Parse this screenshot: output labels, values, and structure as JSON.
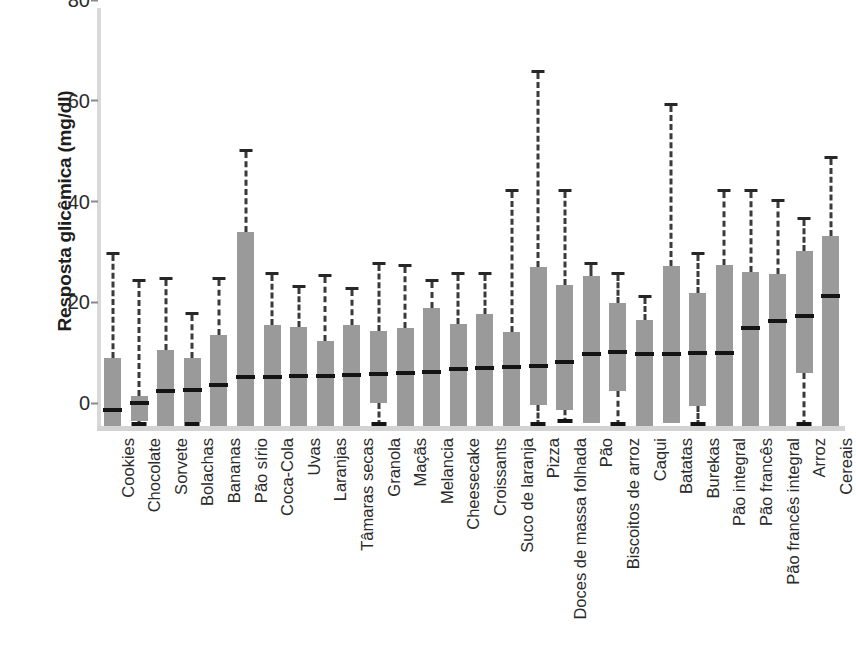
{
  "chart_data": {
    "type": "box",
    "title": "",
    "xlabel": "",
    "ylabel": "Resposta glicêmica (mg/dl)",
    "ylim": [
      0,
      83
    ],
    "yticks": [
      0,
      20,
      40,
      60,
      80
    ],
    "grid": false,
    "legend": "none",
    "units": "mg/dl",
    "categories": [
      "Cookies",
      "Chocolate",
      "Sorvete",
      "Bolachas",
      "Bananas",
      "Pão sírio",
      "Coca-Cola",
      "Uvas",
      "Laranjas",
      "Tâmaras secas",
      "Granola",
      "Maçãs",
      "Melancia",
      "Cheesecake",
      "Croissants",
      "Suco de laranja",
      "Pizza",
      "Doces de massa folhada",
      "Pão",
      "Biscoitos de arroz",
      "Caqui",
      "Batatas",
      "Burekas",
      "Pão integral",
      "Pão francês",
      "Pão francês integral",
      "Arroz",
      "Cereais"
    ],
    "boxes": [
      {
        "label": "Cookies",
        "whisker_low": 0,
        "q1": 0,
        "median": 2.8,
        "q3": 13.5,
        "whisker_high": 34.0
      },
      {
        "label": "Chocolate",
        "whisker_low": 0,
        "q1": 1.0,
        "median": 4.2,
        "q3": 6.0,
        "whisker_high": 28.5
      },
      {
        "label": "Sorvete",
        "whisker_low": 0,
        "q1": 0,
        "median": 6.6,
        "q3": 15.0,
        "whisker_high": 29.0
      },
      {
        "label": "Bolachas",
        "whisker_low": 0,
        "q1": 0.8,
        "median": 6.7,
        "q3": 13.5,
        "whisker_high": 22.0
      },
      {
        "label": "Bananas",
        "whisker_low": 0,
        "q1": 0,
        "median": 7.8,
        "q3": 18.0,
        "whisker_high": 29.0
      },
      {
        "label": "Pão sírio",
        "whisker_low": 0,
        "q1": 0,
        "median": 9.3,
        "q3": 38.5,
        "whisker_high": 54.5
      },
      {
        "label": "Coca-Cola",
        "whisker_low": 0,
        "q1": 0,
        "median": 9.4,
        "q3": 20.0,
        "whisker_high": 30.0
      },
      {
        "label": "Uvas",
        "whisker_low": 0,
        "q1": 0,
        "median": 9.5,
        "q3": 19.7,
        "whisker_high": 27.5
      },
      {
        "label": "Laranjas",
        "whisker_low": 0,
        "q1": 0,
        "median": 9.6,
        "q3": 16.8,
        "whisker_high": 29.5
      },
      {
        "label": "Tâmaras secas",
        "whisker_low": 0,
        "q1": 0,
        "median": 9.8,
        "q3": 20.0,
        "whisker_high": 27.0
      },
      {
        "label": "Granola",
        "whisker_low": 0,
        "q1": 4.5,
        "median": 10.0,
        "q3": 18.8,
        "whisker_high": 32.0
      },
      {
        "label": "Maçãs",
        "whisker_low": 0,
        "q1": 0,
        "median": 10.2,
        "q3": 19.5,
        "whisker_high": 31.5
      },
      {
        "label": "Melancia",
        "whisker_low": 0,
        "q1": 0,
        "median": 10.4,
        "q3": 23.5,
        "whisker_high": 28.5
      },
      {
        "label": "Cheesecake",
        "whisker_low": 0,
        "q1": 0,
        "median": 11.0,
        "q3": 20.2,
        "whisker_high": 30.0
      },
      {
        "label": "Croissants",
        "whisker_low": 0,
        "q1": 0,
        "median": 11.2,
        "q3": 22.2,
        "whisker_high": 30.0
      },
      {
        "label": "Suco de laranja",
        "whisker_low": 0,
        "q1": 0,
        "median": 11.3,
        "q3": 18.7,
        "whisker_high": 46.5
      },
      {
        "label": "Pizza",
        "whisker_low": 0,
        "q1": 4.2,
        "median": 11.6,
        "q3": 31.5,
        "whisker_high": 70.0
      },
      {
        "label": "Doces de massa folhada",
        "whisker_low": 0.5,
        "q1": 3.2,
        "median": 12.4,
        "q3": 28.0,
        "whisker_high": 46.5
      },
      {
        "label": "Pão",
        "whisker_low": 0,
        "q1": 0.5,
        "median": 14.0,
        "q3": 29.8,
        "whisker_high": 32.0
      },
      {
        "label": "Biscoitos de arroz",
        "whisker_low": 0,
        "q1": 7.0,
        "median": 14.3,
        "q3": 24.5,
        "whisker_high": 30.0
      },
      {
        "label": "Caqui",
        "whisker_low": 0,
        "q1": 0,
        "median": 14.0,
        "q3": 21.0,
        "whisker_high": 25.5
      },
      {
        "label": "Batatas",
        "whisker_low": 0,
        "q1": 0.5,
        "median": 14.0,
        "q3": 31.8,
        "whisker_high": 63.5
      },
      {
        "label": "Burekas",
        "whisker_low": 0,
        "q1": 4.0,
        "median": 14.2,
        "q3": 26.5,
        "whisker_high": 34.0
      },
      {
        "label": "Pão integral",
        "whisker_low": 0,
        "q1": 0,
        "median": 14.2,
        "q3": 32.0,
        "whisker_high": 46.5
      },
      {
        "label": "Pão francês",
        "whisker_low": 0,
        "q1": 0,
        "median": 19.0,
        "q3": 30.5,
        "whisker_high": 46.5
      },
      {
        "label": "Pão francês integral",
        "whisker_low": 0,
        "q1": 0,
        "median": 20.5,
        "q3": 30.2,
        "whisker_high": 44.5
      },
      {
        "label": "Arroz",
        "whisker_low": 0,
        "q1": 10.5,
        "median": 21.5,
        "q3": 34.8,
        "whisker_high": 41.0
      },
      {
        "label": "Cereais",
        "whisker_low": 0,
        "q1": 0,
        "median": 25.5,
        "q3": 37.8,
        "whisker_high": 53.0
      }
    ],
    "colors": {
      "box_fill": "#9a9a9a",
      "median_line": "#141414",
      "whisker": "#3a3a3a",
      "axis": "#d6d6d6",
      "background": "#ffffff",
      "text": "#2b2b2b"
    }
  }
}
